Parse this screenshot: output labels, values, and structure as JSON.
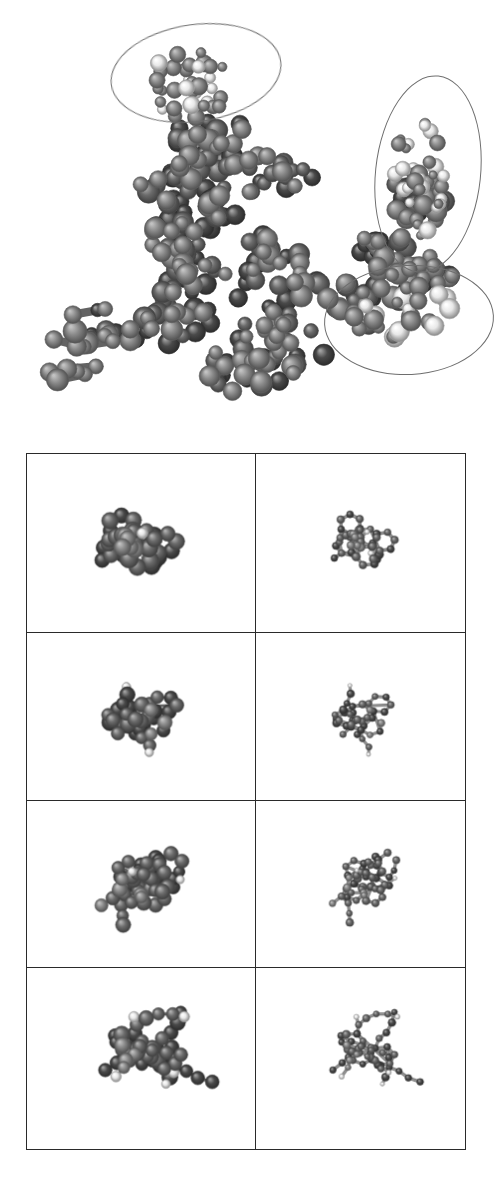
{
  "figure": {
    "kind": "molecular-structure-figure",
    "background_color": "#ffffff",
    "width": 499,
    "height": 1194,
    "caption": ""
  },
  "palette": {
    "carbon_dark": "#4a4a4a",
    "carbon_mid": "#6b6b6b",
    "carbon_light": "#8a8a8a",
    "hydrogen_white": "#e8e8e8",
    "heteroatom_dark": "#3a3a3a",
    "bond_gray": "#707070",
    "annotation_outline": "#6e6e6e",
    "panel_border": "#2a2a2a"
  },
  "top_panel": {
    "name": "space-filling-overview",
    "representation": "space-filling",
    "label": "",
    "bounds": {
      "x": 0,
      "y": 0,
      "width": 499,
      "height": 440
    },
    "annotations": [
      {
        "id": "ellipse-top-left",
        "shape": "ellipse",
        "label": "",
        "cx": 195,
        "cy": 72,
        "rx": 85,
        "ry": 48,
        "rotation": -8
      },
      {
        "id": "ellipse-right-upper",
        "shape": "ellipse",
        "label": "",
        "cx": 427,
        "cy": 173,
        "rx": 52,
        "ry": 98,
        "rotation": 6
      },
      {
        "id": "ellipse-right-lower",
        "shape": "ellipse",
        "label": "",
        "cx": 408,
        "cy": 319,
        "rx": 84,
        "ry": 54,
        "rotation": -3
      }
    ]
  },
  "grid_panel": {
    "name": "molecule-comparison-grid",
    "rows": 4,
    "columns": 2,
    "bounds": {
      "x": 26,
      "y": 453,
      "width": 440,
      "height": 697
    },
    "column_headers": [
      "",
      ""
    ],
    "column_representations": [
      "space-filling",
      "ball-and-stick"
    ],
    "cells": [
      {
        "row": 1,
        "col": 1,
        "id": "cell-r1c1",
        "label": "",
        "representation": "space-filling",
        "description": "branched cluster, upper-right pale tail"
      },
      {
        "row": 1,
        "col": 2,
        "id": "cell-r1c2",
        "label": "",
        "representation": "ball-and-stick",
        "description": "fused ring core with upper-right chain"
      },
      {
        "row": 2,
        "col": 1,
        "id": "cell-r2c1",
        "label": "",
        "representation": "space-filling",
        "description": "flat horizontal sheet with pale right tail"
      },
      {
        "row": 2,
        "col": 2,
        "id": "cell-r2c2",
        "label": "",
        "representation": "ball-and-stick",
        "description": "planar tricyclic aromatic, substituents"
      },
      {
        "row": 3,
        "col": 1,
        "id": "cell-r3c1",
        "label": "",
        "representation": "space-filling",
        "description": "diagonal ring network with lower tail"
      },
      {
        "row": 3,
        "col": 2,
        "id": "cell-r3c2",
        "label": "",
        "representation": "ball-and-stick",
        "description": "ring system with lower-right side chain"
      },
      {
        "row": 4,
        "col": 1,
        "id": "cell-r4c1",
        "label": "",
        "representation": "space-filling",
        "description": "extended horizontal chain conformer"
      },
      {
        "row": 4,
        "col": 2,
        "id": "cell-r4c2",
        "label": "",
        "representation": "ball-and-stick",
        "description": "extended chain conformer, skeletal"
      }
    ]
  },
  "chart_data": {
    "type": "scatter",
    "title": "",
    "xlabel": "",
    "ylabel": "",
    "note": "Rendered molecular geometry; atoms are plotted as 3D-projected spheres with bonds."
  },
  "molecules": {
    "top_overview": {
      "atoms": [
        {
          "x": 0.12,
          "y": 0.62,
          "z": 0.3,
          "r": 0.05,
          "t": "C"
        },
        {
          "x": 0.1,
          "y": 0.68,
          "z": 0.2,
          "r": 0.048,
          "t": "C"
        },
        {
          "x": 0.09,
          "y": 0.55,
          "z": 0.25,
          "r": 0.046,
          "t": "C"
        },
        {
          "x": 0.14,
          "y": 0.5,
          "z": 0.35,
          "r": 0.05,
          "t": "C"
        },
        {
          "x": 0.17,
          "y": 0.58,
          "z": 0.42,
          "r": 0.052,
          "t": "C"
        },
        {
          "x": 0.2,
          "y": 0.66,
          "z": 0.38,
          "r": 0.05,
          "t": "C"
        },
        {
          "x": 0.16,
          "y": 0.74,
          "z": 0.28,
          "r": 0.048,
          "t": "C"
        },
        {
          "x": 0.22,
          "y": 0.78,
          "z": 0.34,
          "r": 0.05,
          "t": "C"
        },
        {
          "x": 0.26,
          "y": 0.7,
          "z": 0.44,
          "r": 0.052,
          "t": "C"
        },
        {
          "x": 0.24,
          "y": 0.6,
          "z": 0.48,
          "r": 0.05,
          "t": "C"
        },
        {
          "x": 0.28,
          "y": 0.52,
          "z": 0.42,
          "r": 0.048,
          "t": "C"
        },
        {
          "x": 0.32,
          "y": 0.6,
          "z": 0.5,
          "r": 0.052,
          "t": "C"
        },
        {
          "x": 0.3,
          "y": 0.72,
          "z": 0.52,
          "r": 0.05,
          "t": "C"
        },
        {
          "x": 0.36,
          "y": 0.78,
          "z": 0.46,
          "r": 0.048,
          "t": "C"
        },
        {
          "x": 0.4,
          "y": 0.68,
          "z": 0.54,
          "r": 0.052,
          "t": "C"
        },
        {
          "x": 0.38,
          "y": 0.56,
          "z": 0.56,
          "r": 0.05,
          "t": "C"
        },
        {
          "x": 0.34,
          "y": 0.46,
          "z": 0.48,
          "r": 0.048,
          "t": "C"
        },
        {
          "x": 0.42,
          "y": 0.48,
          "z": 0.58,
          "r": 0.05,
          "t": "C"
        },
        {
          "x": 0.46,
          "y": 0.58,
          "z": 0.6,
          "r": 0.052,
          "t": "C"
        },
        {
          "x": 0.44,
          "y": 0.7,
          "z": 0.58,
          "r": 0.05,
          "t": "C"
        },
        {
          "x": 0.48,
          "y": 0.8,
          "z": 0.52,
          "r": 0.048,
          "t": "C"
        },
        {
          "x": 0.52,
          "y": 0.7,
          "z": 0.6,
          "r": 0.052,
          "t": "C"
        },
        {
          "x": 0.54,
          "y": 0.58,
          "z": 0.62,
          "r": 0.05,
          "t": "C"
        },
        {
          "x": 0.5,
          "y": 0.48,
          "z": 0.58,
          "r": 0.048,
          "t": "C"
        },
        {
          "x": 0.56,
          "y": 0.46,
          "z": 0.6,
          "r": 0.05,
          "t": "C"
        },
        {
          "x": 0.6,
          "y": 0.56,
          "z": 0.64,
          "r": 0.052,
          "t": "C"
        },
        {
          "x": 0.58,
          "y": 0.68,
          "z": 0.62,
          "r": 0.05,
          "t": "C"
        },
        {
          "x": 0.62,
          "y": 0.78,
          "z": 0.56,
          "r": 0.048,
          "t": "C"
        },
        {
          "x": 0.66,
          "y": 0.68,
          "z": 0.6,
          "r": 0.05,
          "t": "C"
        },
        {
          "x": 0.68,
          "y": 0.56,
          "z": 0.62,
          "r": 0.052,
          "t": "C"
        },
        {
          "x": 0.64,
          "y": 0.46,
          "z": 0.58,
          "r": 0.048,
          "t": "C"
        },
        {
          "x": 0.7,
          "y": 0.44,
          "z": 0.56,
          "r": 0.05,
          "t": "C"
        },
        {
          "x": 0.74,
          "y": 0.54,
          "z": 0.58,
          "r": 0.05,
          "t": "C"
        },
        {
          "x": 0.72,
          "y": 0.66,
          "z": 0.56,
          "r": 0.048,
          "t": "C"
        },
        {
          "x": 0.76,
          "y": 0.76,
          "z": 0.5,
          "r": 0.046,
          "t": "C"
        },
        {
          "x": 0.8,
          "y": 0.64,
          "z": 0.52,
          "r": 0.048,
          "t": "C"
        },
        {
          "x": 0.82,
          "y": 0.52,
          "z": 0.5,
          "r": 0.046,
          "t": "C"
        },
        {
          "x": 0.78,
          "y": 0.42,
          "z": 0.48,
          "r": 0.044,
          "t": "C"
        },
        {
          "x": 0.3,
          "y": 0.34,
          "z": 0.4,
          "r": 0.044,
          "t": "C"
        },
        {
          "x": 0.34,
          "y": 0.26,
          "z": 0.44,
          "r": 0.04,
          "t": "C"
        },
        {
          "x": 0.38,
          "y": 0.18,
          "z": 0.4,
          "r": 0.038,
          "t": "C"
        },
        {
          "x": 0.42,
          "y": 0.12,
          "z": 0.44,
          "r": 0.036,
          "t": "H"
        },
        {
          "x": 0.28,
          "y": 0.2,
          "z": 0.36,
          "r": 0.034,
          "t": "H"
        },
        {
          "x": 0.24,
          "y": 0.14,
          "z": 0.32,
          "r": 0.032,
          "t": "H"
        },
        {
          "x": 0.46,
          "y": 0.1,
          "z": 0.48,
          "r": 0.04,
          "t": "C"
        },
        {
          "x": 0.5,
          "y": 0.16,
          "z": 0.52,
          "r": 0.038,
          "t": "C"
        },
        {
          "x": 0.44,
          "y": 0.24,
          "z": 0.46,
          "r": 0.036,
          "t": "H"
        },
        {
          "x": 0.88,
          "y": 0.24,
          "z": 0.44,
          "r": 0.036,
          "t": "H"
        },
        {
          "x": 0.9,
          "y": 0.32,
          "z": 0.46,
          "r": 0.034,
          "t": "H"
        },
        {
          "x": 0.86,
          "y": 0.4,
          "z": 0.44,
          "r": 0.036,
          "t": "H"
        },
        {
          "x": 0.92,
          "y": 0.48,
          "z": 0.42,
          "r": 0.034,
          "t": "H"
        },
        {
          "x": 0.84,
          "y": 0.56,
          "z": 0.44,
          "r": 0.036,
          "t": "H"
        },
        {
          "x": 0.9,
          "y": 0.64,
          "z": 0.4,
          "r": 0.034,
          "t": "H"
        },
        {
          "x": 0.86,
          "y": 0.72,
          "z": 0.38,
          "r": 0.036,
          "t": "H"
        },
        {
          "x": 0.92,
          "y": 0.8,
          "z": 0.36,
          "r": 0.034,
          "t": "H"
        }
      ]
    }
  }
}
